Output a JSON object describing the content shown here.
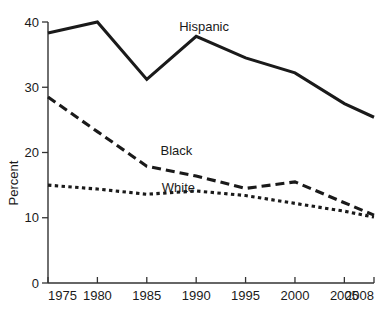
{
  "chart_data": {
    "type": "line",
    "title": "",
    "xlabel": "",
    "ylabel": "Percent",
    "x": [
      1975,
      1980,
      1985,
      1990,
      1995,
      2000,
      2005,
      2008
    ],
    "xtick_labels": [
      "1975",
      "1980",
      "1985",
      "1990",
      "1995",
      "2000",
      "2005",
      "2008"
    ],
    "ytick_labels": [
      "0",
      "10",
      "20",
      "30",
      "40"
    ],
    "yticks": [
      0,
      10,
      20,
      30,
      40
    ],
    "xlim": [
      1975,
      2008
    ],
    "ylim": [
      0,
      40
    ],
    "grid": false,
    "legend_position": "inline-annotations",
    "series": [
      {
        "name": "Hispanic",
        "style": "solid",
        "color": "#1a1a1a",
        "values": [
          38.3,
          40.0,
          31.2,
          37.8,
          34.5,
          32.2,
          27.5,
          25.4
        ],
        "label_x": 1990.8,
        "label_y": 38.6
      },
      {
        "name": "Black",
        "style": "long-dash",
        "color": "#1a1a1a",
        "values": [
          28.5,
          23.2,
          17.9,
          16.4,
          14.5,
          15.5,
          12.3,
          10.4
        ],
        "label_x": 1988.0,
        "label_y": 19.6
      },
      {
        "name": "White",
        "style": "short-dash",
        "color": "#1a1a1a",
        "values": [
          15.0,
          14.4,
          13.6,
          14.1,
          13.4,
          12.2,
          11.0,
          10.1
        ],
        "label_x": 1988.2,
        "label_y": 14.0
      }
    ],
    "annotations": [
      {
        "text": "Hispanic",
        "series": "Hispanic"
      },
      {
        "text": "Black",
        "series": "Black"
      },
      {
        "text": "White",
        "series": "White"
      }
    ]
  }
}
